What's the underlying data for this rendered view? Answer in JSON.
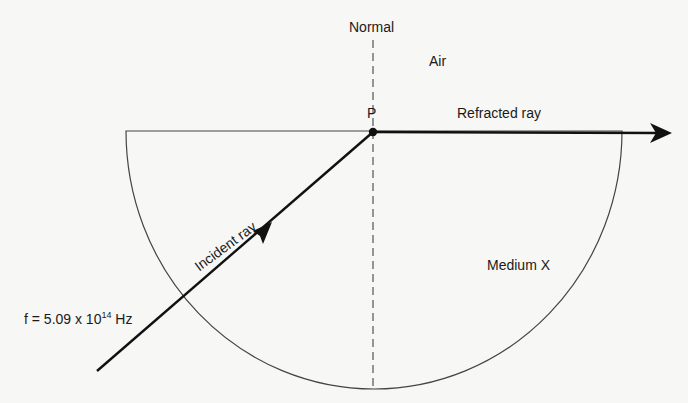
{
  "diagram": {
    "labels": {
      "normal": "Normal",
      "air": "Air",
      "point": "P",
      "refracted_ray": "Refracted ray",
      "incident_ray": "Incident ray",
      "medium": "Medium X",
      "frequency_prefix": "f = 5.09 x 10",
      "frequency_exponent": "14",
      "frequency_unit": " Hz"
    },
    "elements": {
      "medium_shape": "semicircle",
      "normal_line": "dashed vertical",
      "incident_ray_direction": "from lower-left toward P",
      "refracted_ray_direction": "from P to the right along surface"
    },
    "colors": {
      "background": "#f7f7f5",
      "ink": "#111111",
      "outline": "#444444"
    }
  }
}
